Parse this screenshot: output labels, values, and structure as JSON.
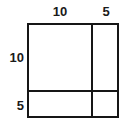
{
  "figure": {
    "kind": "partitioned-rectangle-area-model",
    "outer_rectangle": {
      "fill_color": "#ffffff",
      "stroke_color": "#161616"
    },
    "top_labels": [
      {
        "value": "10",
        "segment": "left-column-width"
      },
      {
        "value": "5",
        "segment": "right-column-width"
      }
    ],
    "side_labels": [
      {
        "value": "10",
        "segment": "top-row-height"
      },
      {
        "value": "5",
        "segment": "bottom-row-height"
      }
    ]
  },
  "chart_data": {
    "type": "table",
    "title": "",
    "xlabel": "",
    "ylabel": "",
    "column_widths": [
      10,
      5
    ],
    "row_heights": [
      10,
      5
    ],
    "column_labels": [
      "10",
      "5"
    ],
    "row_labels": [
      "10",
      "5"
    ],
    "cells": [
      {
        "row": 0,
        "col": 0,
        "width": 10,
        "height": 10,
        "label": ""
      },
      {
        "row": 0,
        "col": 1,
        "width": 5,
        "height": 10,
        "label": ""
      },
      {
        "row": 1,
        "col": 0,
        "width": 10,
        "height": 5,
        "label": ""
      },
      {
        "row": 1,
        "col": 1,
        "width": 5,
        "height": 5,
        "label": ""
      }
    ],
    "total_width": 15,
    "total_height": 15,
    "grid": false,
    "legend": false
  }
}
